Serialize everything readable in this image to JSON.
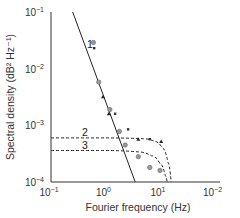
{
  "chart_data": {
    "type": "line",
    "title": "",
    "xlabel": "Fourier frequency (Hz)",
    "ylabel": "Spectral density (dB² Hz⁻¹)",
    "xscale": "log",
    "yscale": "log",
    "xlim": [
      0.1,
      100
    ],
    "ylim": [
      0.0001,
      0.1
    ],
    "x_tick_labels": [
      {
        "base": "10",
        "exp": "−1",
        "value": 0.1
      },
      {
        "base": "10",
        "exp": "0",
        "value": 1
      },
      {
        "base": "10",
        "exp": "1",
        "value": 10
      },
      {
        "base": "10",
        "exp": "−2",
        "value": 100
      }
    ],
    "y_tick_labels": [
      {
        "base": "10",
        "exp": "−1",
        "value": 0.1
      },
      {
        "base": "10",
        "exp": "−2",
        "value": 0.01
      },
      {
        "base": "10",
        "exp": "−3",
        "value": 0.001
      },
      {
        "base": "10",
        "exp": "−4",
        "value": 0.0001
      }
    ],
    "grid": false,
    "legend": "none (curves labelled inline 1, 2, 3)",
    "series": [
      {
        "name": "1",
        "style": "solid",
        "points": [
          [
            0.25,
            0.1
          ],
          [
            3.5,
            0.0001
          ]
        ]
      },
      {
        "name": "2",
        "style": "dashed",
        "points": [
          [
            0.1,
            0.0006
          ],
          [
            1,
            0.0006
          ],
          [
            5,
            0.00058
          ],
          [
            8,
            0.00052
          ],
          [
            11,
            0.0004
          ],
          [
            14,
            0.00022
          ],
          [
            16,
            0.0001
          ]
        ]
      },
      {
        "name": "3",
        "style": "dashed",
        "points": [
          [
            0.1,
            0.00036
          ],
          [
            1,
            0.00036
          ],
          [
            4,
            0.00034
          ],
          [
            7,
            0.00029
          ],
          [
            10,
            0.00021
          ],
          [
            12.5,
            0.00013
          ],
          [
            13.5,
            0.0001
          ]
        ]
      }
    ],
    "markers": [
      {
        "type": "circle",
        "x": 0.6,
        "y": 0.029
      },
      {
        "type": "x",
        "x": 0.62,
        "y": 0.023
      },
      {
        "type": "circle",
        "x": 0.75,
        "y": 0.0058
      },
      {
        "type": "triangle",
        "x": 0.9,
        "y": 0.0032
      },
      {
        "type": "circle",
        "x": 1.2,
        "y": 0.0019
      },
      {
        "type": "triangle",
        "x": 1.15,
        "y": 0.0016
      },
      {
        "type": "x",
        "x": 1.5,
        "y": 0.0016
      },
      {
        "type": "circle",
        "x": 1.8,
        "y": 0.00078
      },
      {
        "type": "x",
        "x": 2.6,
        "y": 0.00085
      },
      {
        "type": "circle",
        "x": 2.3,
        "y": 0.00045
      },
      {
        "type": "triangle",
        "x": 4.0,
        "y": 0.00057
      },
      {
        "type": "x",
        "x": 6.5,
        "y": 0.00057
      },
      {
        "type": "triangle",
        "x": 10.5,
        "y": 0.00052
      },
      {
        "type": "circle",
        "x": 4.0,
        "y": 0.00028
      },
      {
        "type": "circle",
        "x": 6.5,
        "y": 0.00018
      },
      {
        "type": "circle",
        "x": 10,
        "y": 0.00016
      }
    ],
    "curve_labels": [
      {
        "text": "1",
        "x": 0.4,
        "y": 0.018
      },
      {
        "text": "2",
        "x": 0.4,
        "y": 0.00075
      },
      {
        "text": "3",
        "x": 0.4,
        "y": 0.00045
      }
    ]
  }
}
